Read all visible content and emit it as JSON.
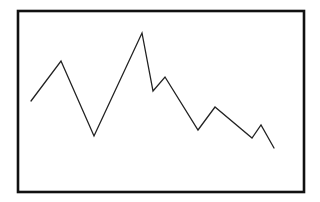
{
  "figure": {
    "type": "line-sketch",
    "frame_color": "#111111",
    "line_color": "#222222",
    "background": "#ffffff"
  },
  "chart_data": {
    "type": "line",
    "title": "",
    "xlabel": "",
    "ylabel": "",
    "grid": false,
    "legend": null,
    "axes_labeled": false,
    "frame": {
      "x": 18,
      "y": 11,
      "width": 286,
      "height": 181
    },
    "points_px": [
      [
        31,
        101
      ],
      [
        61,
        61
      ],
      [
        94,
        136
      ],
      [
        142,
        33
      ],
      [
        153,
        91
      ],
      [
        165,
        77
      ],
      [
        198,
        130
      ],
      [
        215,
        107
      ],
      [
        252,
        138
      ],
      [
        261,
        125
      ],
      [
        274,
        148
      ]
    ],
    "x": [
      0,
      1,
      2,
      3,
      4,
      5,
      6,
      7,
      8,
      9,
      10
    ],
    "values_relative": [
      47,
      75,
      12,
      87,
      49,
      59,
      22,
      38,
      16,
      25,
      0
    ]
  }
}
